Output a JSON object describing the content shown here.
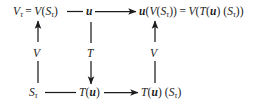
{
  "diagram": {
    "type": "commutative-diagram",
    "background_color": "#ffffff",
    "ink_color": "#1c1c1c",
    "nodes": {
      "top_left": {
        "id": "V_tau",
        "text": "V_τ = V(S_τ)"
      },
      "top_middle": {
        "id": "u",
        "text": "u"
      },
      "top_right": {
        "id": "u_V_S_tau",
        "text": "u(V(S_τ)) = V(T(u)(S_τ))"
      },
      "bottom_left": {
        "id": "S_tau",
        "text": "S_τ"
      },
      "bottom_middle": {
        "id": "T_u",
        "text": "T(u)"
      },
      "bottom_right": {
        "id": "T_u_S_tau",
        "text": "T(u)(S_τ)"
      }
    },
    "arrows": [
      {
        "id": "top-left-to-middle",
        "from": "top_left",
        "to": "top_middle",
        "direction": "right",
        "label": ""
      },
      {
        "id": "top-middle-to-right",
        "from": "top_middle",
        "to": "top_right",
        "direction": "right",
        "label": ""
      },
      {
        "id": "bottom-left-to-middle",
        "from": "bottom_left",
        "to": "bottom_middle",
        "direction": "right",
        "label": ""
      },
      {
        "id": "bottom-middle-to-right",
        "from": "bottom_middle",
        "to": "bottom_right",
        "direction": "right",
        "label": ""
      },
      {
        "id": "left-vertical",
        "from": "bottom_left",
        "to": "top_left",
        "direction": "up",
        "label": "V"
      },
      {
        "id": "middle-vertical",
        "from": "top_middle",
        "to": "bottom_middle",
        "direction": "down",
        "label": "T"
      },
      {
        "id": "right-vertical",
        "from": "bottom_right",
        "to": "top_right",
        "direction": "up",
        "label": "V"
      }
    ],
    "labels": {
      "left_vertical": "V",
      "middle_vertical": "T",
      "right_vertical": "V"
    },
    "symbols": {
      "tau": "τ",
      "equals": "=",
      "V": "V",
      "T": "T",
      "u": "u",
      "S": "S"
    }
  }
}
